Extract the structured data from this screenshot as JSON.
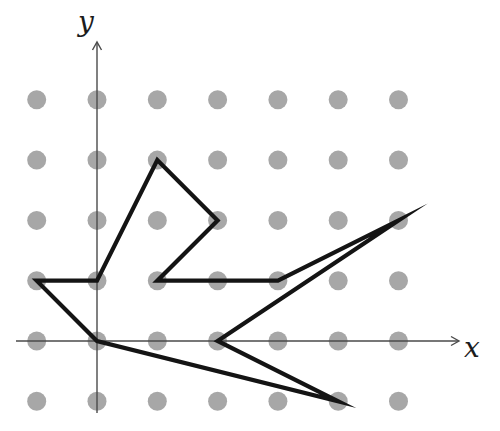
{
  "figure": {
    "axis_labels": {
      "x": "x",
      "y": "y"
    },
    "lattice": {
      "x_min": -1,
      "x_max": 5,
      "y_min": -1,
      "y_max": 4
    },
    "polygon_vertices": [
      [
        -1,
        1
      ],
      [
        0,
        1
      ],
      [
        1,
        3
      ],
      [
        2,
        2
      ],
      [
        1,
        1
      ],
      [
        3,
        1
      ],
      [
        5,
        2
      ],
      [
        2,
        0
      ],
      [
        4,
        -1
      ],
      [
        0,
        0
      ]
    ],
    "colors": {
      "background": "#ffffff",
      "dot": "#a7a7a7",
      "polygon": "#141414",
      "axis": "#4a4a4a",
      "label": "#1c1c1c"
    },
    "layout": {
      "width": 500,
      "height": 431,
      "origin_px": [
        97,
        341
      ],
      "unit_px": 60.3,
      "dot_radius_px": 9.5,
      "polygon_stroke_px": 4.2,
      "axis_stroke_px": 1.4,
      "arrow_barb_px": 8,
      "arrow_half_width_px": 4.5,
      "x_axis": {
        "from_px": 16,
        "tip_px": 459,
        "label_px": [
          472,
          357
        ]
      },
      "y_axis": {
        "from_px": 413,
        "tip_px": 42,
        "label_px": [
          86,
          31
        ]
      }
    }
  }
}
